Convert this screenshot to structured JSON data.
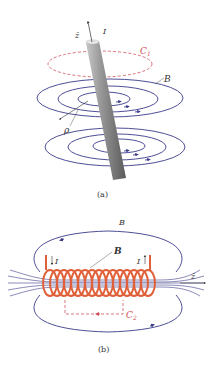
{
  "figure_a": {
    "caption": "(a)",
    "labels": {
      "axis": "ẑ",
      "current": "I",
      "contour": "C",
      "contour_sub": "1",
      "field": "B",
      "radius": "ρ"
    },
    "colors": {
      "wire": "#9a9a9a",
      "field_lines": "#3a3a8a",
      "contour": "#d0505a"
    }
  },
  "figure_b": {
    "caption": "(b)",
    "labels": {
      "outer_field": "B",
      "inner_field": "B",
      "current_left": "I",
      "current_right": "I",
      "axis": "ẑ",
      "contour": "C",
      "contour_sub": "2"
    },
    "colors": {
      "coil": "#e0603a",
      "field_lines": "#3a3a8a",
      "contour": "#d0505a"
    }
  }
}
